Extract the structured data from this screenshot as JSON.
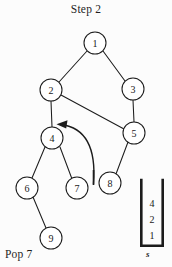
{
  "title": "Step 2",
  "caption": "Pop 7",
  "colors": {
    "background": "#fcfcfc",
    "ink": "#1c1c1c",
    "node_fill": "#ffffff"
  },
  "graph": {
    "node_radius": 11,
    "nodes": [
      {
        "id": "1",
        "label": "1",
        "cx": 95,
        "cy": 43
      },
      {
        "id": "2",
        "label": "2",
        "cx": 51,
        "cy": 90
      },
      {
        "id": "3",
        "label": "3",
        "cx": 133,
        "cy": 89
      },
      {
        "id": "4",
        "label": "4",
        "cx": 52,
        "cy": 138
      },
      {
        "id": "5",
        "label": "5",
        "cx": 134,
        "cy": 133
      },
      {
        "id": "6",
        "label": "6",
        "cx": 27,
        "cy": 188
      },
      {
        "id": "7",
        "label": "7",
        "cx": 77,
        "cy": 188
      },
      {
        "id": "8",
        "label": "8",
        "cx": 110,
        "cy": 183
      },
      {
        "id": "9",
        "label": "9",
        "cx": 51,
        "cy": 238
      }
    ],
    "edges": [
      {
        "from": "1",
        "to": "2"
      },
      {
        "from": "1",
        "to": "3"
      },
      {
        "from": "2",
        "to": "4"
      },
      {
        "from": "2",
        "to": "5"
      },
      {
        "from": "3",
        "to": "5"
      },
      {
        "from": "5",
        "to": "8"
      },
      {
        "from": "4",
        "to": "6"
      },
      {
        "from": "4",
        "to": "7"
      },
      {
        "from": "6",
        "to": "9"
      }
    ],
    "pop_arrow": {
      "description": "curved arrow from popped node area back up to node 4",
      "tail": {
        "x": 93,
        "y": 184
      },
      "head": {
        "x": 58,
        "y": 124
      }
    }
  },
  "stack": {
    "name": "s",
    "label": "s",
    "items_top_to_bottom": [
      "4",
      "2",
      "1"
    ],
    "box": {
      "x": 140,
      "y": 180,
      "width": 24,
      "height": 67
    }
  }
}
